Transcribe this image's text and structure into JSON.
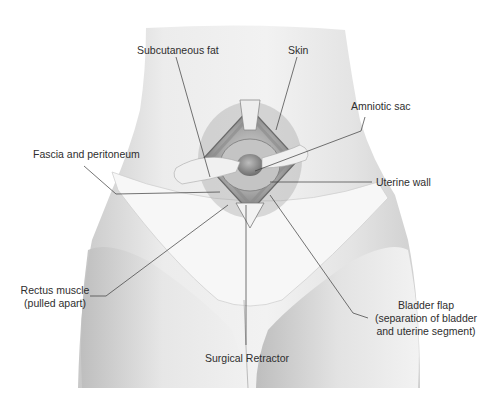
{
  "figure": {
    "type": "labeled anatomical illustration"
  },
  "labels": {
    "subcutaneous_fat": "Subcutaneous fat",
    "skin": "Skin",
    "amniotic_sac": "Amniotic sac",
    "fascia_peritoneum": "Fascia and peritoneum",
    "uterine_wall": "Uterine wall",
    "rectus_muscle_line1": "Rectus muscle",
    "rectus_muscle_line2": "(pulled apart)",
    "bladder_flap_line1": "Bladder flap",
    "bladder_flap_line2": "(separation of bladder",
    "bladder_flap_line3": "and uterine segment)",
    "surgical_retractor": "Surgical Retractor"
  },
  "colors": {
    "background": "#ffffff",
    "skin_shade": "#dcdcdc",
    "leader_line": "#3a3a3a",
    "label_text": "#2e2e2e"
  }
}
